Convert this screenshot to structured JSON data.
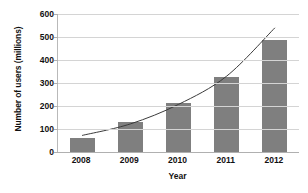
{
  "chart_data": {
    "type": "bar",
    "title": "",
    "subtitle": "",
    "xlabel": "Year",
    "ylabel": "Number of users (millions)",
    "categories": [
      "2008",
      "2009",
      "2010",
      "2011",
      "2012"
    ],
    "values": [
      62,
      132,
      213,
      327,
      487
    ],
    "series": [
      {
        "name": "Number of users (millions)",
        "type": "bar",
        "values": [
          62,
          132,
          213,
          327,
          487
        ],
        "color": "#7f7f7f"
      },
      {
        "name": "Exponential trend",
        "type": "line",
        "values": [
          72,
          122,
          207,
          330,
          540
        ],
        "color": "#3b3b3b"
      }
    ],
    "ylim": [
      0,
      600
    ],
    "yticks": [
      0,
      100,
      200,
      300,
      400,
      500,
      600
    ],
    "ytick_labels": [
      "0",
      "100",
      "200",
      "300",
      "400",
      "500",
      "600"
    ],
    "grid": "horizontal",
    "legend": "none",
    "annotations": []
  },
  "axes": {
    "y_title": "Number of users (millions)",
    "x_title": "Year"
  },
  "colors": {
    "bar_fill": "#7f7f7f",
    "trend_line": "#3b3b3b",
    "gridline": "#d4d4d4",
    "axis_line": "#b0b0b0",
    "text": "#111111",
    "background": "#ffffff"
  }
}
